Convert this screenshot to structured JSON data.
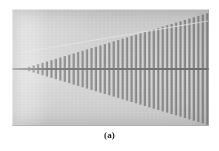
{
  "figure": {
    "caption": "(a)",
    "panel_label": "a",
    "alt_description": "Scanning electron micrograph of a tapered log-periodic grating: vertical bars of linearly increasing height fan out from a narrow apex at the left to the full frame height at the right, bisected by a horizontal spine."
  },
  "micrograph": {
    "background_color": "#d2d2d2",
    "bar_color": "#8a8a8a",
    "bar_shadow_color": "#787878",
    "bar_highlight_color": "#a6a6a6",
    "spine_color": "#6f6f6f",
    "diagonal_line_color": "#e4e4e4",
    "frame": {
      "x": 12,
      "y": 9,
      "width": 197,
      "height": 117
    },
    "structure": {
      "type": "tapered-periodic-grating",
      "apex_x": 10,
      "apex_y": 60,
      "right_edge_x": 196,
      "half_angle_up_y_at_right": 4,
      "half_angle_down_y_at_right": 116,
      "bar_count": 42,
      "bar_period_px": 4.45,
      "bar_duty_cycle": 0.52,
      "spine_y": 60,
      "spine_thickness_px": 2.2,
      "diagonal_line": {
        "x1": 0,
        "y1": 45,
        "x2": 196,
        "y2": 12
      }
    }
  }
}
